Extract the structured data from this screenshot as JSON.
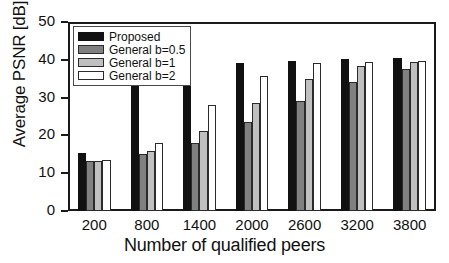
{
  "chart_data": {
    "type": "bar",
    "title": "",
    "xlabel": "Number of qualified peers",
    "ylabel": "Average PSNR [dB]",
    "categories": [
      "200",
      "800",
      "1400",
      "2000",
      "2600",
      "3200",
      "3800"
    ],
    "series": [
      {
        "name": "Proposed",
        "color": "#111111",
        "values": [
          15.4,
          34.9,
          38.2,
          39.1,
          39.7,
          40.2,
          40.5
        ]
      },
      {
        "name": "General b=0.5",
        "color": "#808080",
        "values": [
          13.2,
          15.1,
          18.0,
          23.5,
          29.2,
          34.0,
          37.5
        ]
      },
      {
        "name": "General b=1",
        "color": "#c0c0c0",
        "values": [
          13.3,
          16.0,
          21.1,
          28.6,
          34.9,
          38.4,
          39.5
        ]
      },
      {
        "name": "General b=2",
        "color": "#ffffff",
        "values": [
          13.5,
          18.1,
          28.0,
          35.7,
          39.1,
          39.5,
          39.6
        ]
      }
    ],
    "ylim": [
      0,
      50
    ],
    "yticks": [
      0,
      10,
      20,
      30,
      40,
      50
    ],
    "ytick_labels": [
      "0",
      "10",
      "20",
      "30",
      "40",
      "50"
    ],
    "grid": false,
    "legend_position": "upper-left"
  }
}
